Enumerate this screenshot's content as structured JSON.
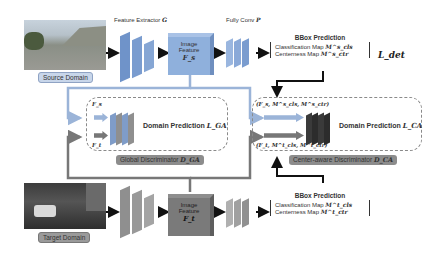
{
  "source": {
    "domain_label": "Source Domain",
    "feature_extractor_label": "Feature Extractor",
    "feature_extractor_symbol": "G",
    "image_feature_line1": "Image",
    "image_feature_line2": "Feature",
    "image_feature_symbol": "F_s",
    "fully_conv_label": "Fully Conv",
    "fully_conv_symbol": "P",
    "bbox_title": "BBox Prediction",
    "cls_map": "Classification Map",
    "cls_symbol": "M^s_cls",
    "ctr_map": "Centerness Map",
    "ctr_symbol": "M^s_ctr",
    "loss": "L_det"
  },
  "global_disc": {
    "input_s": "F_s",
    "input_t": "F_t",
    "prediction": "Domain Prediction",
    "loss": "L_GA",
    "name": "Global Discriminator",
    "symbol": "D_GA"
  },
  "center_disc": {
    "input_s": "(F_s, M^s_cls, M^s_ctr)",
    "input_t": "(F_t, M^t_cls, M^t_ctr)",
    "prediction": "Domain Prediction",
    "loss": "L_CA",
    "name": "Center-aware Discriminator",
    "symbol": "D_CA"
  },
  "target": {
    "domain_label": "Target Domain",
    "image_feature_line1": "Image",
    "image_feature_line2": "Feature",
    "image_feature_symbol": "F_t",
    "bbox_title": "BBox Prediction",
    "cls_map": "Classification Map",
    "cls_symbol": "M^t_cls",
    "ctr_map": "Centerness Map",
    "ctr_symbol": "M^t_ctr"
  },
  "colors": {
    "source_blue": "#6f93c9",
    "source_feature": "#8fb0dc",
    "target_gray": "#7a7a7a",
    "light_gray": "#b8b8b8",
    "dark_block": "#3a3a3a",
    "tag_source": "#c8d6ea",
    "tag_target": "#9a9a9a"
  }
}
